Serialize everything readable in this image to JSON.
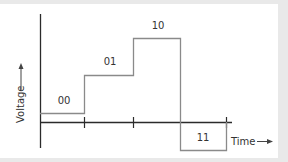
{
  "diagram": {
    "type": "voltage-level-timing",
    "y_axis_label": "Voltage",
    "x_axis_label": "Time",
    "levels": [
      {
        "code": "00",
        "order": 0
      },
      {
        "code": "01",
        "order": 1
      },
      {
        "code": "10",
        "order": 2
      },
      {
        "code": "11",
        "order": 3
      }
    ],
    "colors": {
      "axis": "#2b2b2b",
      "signal": "#8a8a8a",
      "text": "#333333",
      "background": "#ffffff",
      "page": "#e9e9e9"
    }
  }
}
